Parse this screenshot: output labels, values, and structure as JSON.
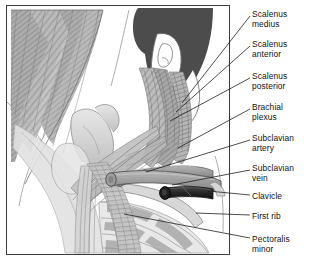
{
  "figure": {
    "type": "medical-anatomy-illustration",
    "style": "grayscale line drawing",
    "caption": "",
    "colors": {
      "border": "#3a3a3a",
      "hair": "#4c4c4c",
      "muscle_mid": "#a8a8a8",
      "muscle_light": "#c9c9c9",
      "bone": "#dcdcdc",
      "vein_dark": "#2e2e2e",
      "artery": "#9a9a9a",
      "outline": "#555555",
      "background": "#ffffff",
      "text": "#111111"
    }
  },
  "labels": [
    {
      "id": "scalenus-medius",
      "text": "Scalenus\nmedius",
      "top": 9,
      "leader": {
        "x1": 250,
        "y1": 16,
        "x2": 182,
        "y2": 103
      }
    },
    {
      "id": "scalenus-anterior",
      "text": "Scalenus\nanterior",
      "top": 39,
      "leader": {
        "x1": 250,
        "y1": 46,
        "x2": 176,
        "y2": 112
      }
    },
    {
      "id": "scalenus-posterior",
      "text": "Scalenus\nposterior",
      "top": 71,
      "leader": {
        "x1": 250,
        "y1": 78,
        "x2": 170,
        "y2": 121
      }
    },
    {
      "id": "brachial-plexus",
      "text": "Brachial\nplexus",
      "top": 102,
      "leader": {
        "x1": 250,
        "y1": 109,
        "x2": 178,
        "y2": 148
      }
    },
    {
      "id": "subclavian-artery",
      "text": "Subclavian\nartery",
      "top": 133,
      "leader": {
        "x1": 250,
        "y1": 140,
        "x2": 146,
        "y2": 172
      }
    },
    {
      "id": "subclavian-vein",
      "text": "Subclavian\nvein",
      "top": 163,
      "leader": {
        "x1": 250,
        "y1": 170,
        "x2": 172,
        "y2": 185
      }
    },
    {
      "id": "clavicle",
      "text": "Clavicle",
      "top": 191,
      "leader": {
        "x1": 250,
        "y1": 195,
        "x2": 208,
        "y2": 191
      }
    },
    {
      "id": "first-rib",
      "text": "First rib",
      "top": 211,
      "leader": {
        "x1": 250,
        "y1": 215,
        "x2": 196,
        "y2": 213
      }
    },
    {
      "id": "pectoralis-minor",
      "text": "Pectoralis\nminor",
      "top": 234,
      "leader": {
        "x1": 250,
        "y1": 238,
        "x2": 124,
        "y2": 214
      }
    }
  ]
}
